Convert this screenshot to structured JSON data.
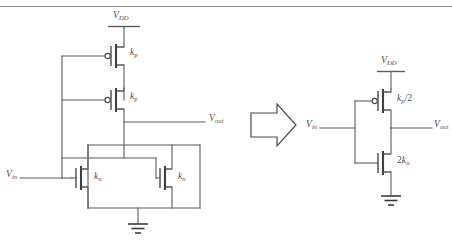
{
  "figure": {
    "line_color": "#5b5b5b",
    "device_color": "#4a4a4a",
    "background": "#ffffff"
  },
  "left_circuit": {
    "name": "stacked-cmos-circuit",
    "supply": {
      "label": "V",
      "sub": "DD"
    },
    "input": {
      "label": "V",
      "sub": "in"
    },
    "output": {
      "label": "V",
      "sub": "out"
    },
    "ground": "ground-symbol",
    "pmos_top": {
      "label": "k",
      "sub": "p",
      "type": "pmos"
    },
    "pmos_bottom": {
      "label": "k",
      "sub": "p",
      "type": "pmos"
    },
    "nmos_left": {
      "label": "k",
      "sub": "n",
      "type": "nmos"
    },
    "nmos_right": {
      "label": "k",
      "sub": "n",
      "type": "nmos"
    }
  },
  "transform_arrow": {
    "name": "transform-arrow",
    "direction": "right",
    "meaning": "is equivalent to"
  },
  "right_circuit": {
    "name": "equivalent-inverter-circuit",
    "supply": {
      "label": "V",
      "sub": "DD"
    },
    "input": {
      "label": "V",
      "sub": "in"
    },
    "output": {
      "label": "V",
      "sub": "out"
    },
    "ground": "ground-symbol",
    "pmos": {
      "label": "k",
      "sub": "p",
      "suffix": "/2",
      "type": "pmos"
    },
    "nmos": {
      "prefix": "2",
      "label": "k",
      "sub": "n",
      "type": "nmos"
    }
  }
}
